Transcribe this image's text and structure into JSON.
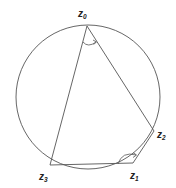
{
  "diagram": {
    "type": "inscribed-quadrilateral-in-circle",
    "circle": {
      "cx": 88,
      "cy": 97,
      "r": 72,
      "stroke": "#555555"
    },
    "points": [
      {
        "id": "z0",
        "base": "z",
        "sub": "0",
        "x": 87,
        "y": 26,
        "label_x": 78,
        "label_y": 17
      },
      {
        "id": "z1",
        "base": "z",
        "sub": "1",
        "x": 133,
        "y": 163,
        "label_x": 130,
        "label_y": 179
      },
      {
        "id": "z2",
        "base": "z",
        "sub": "2",
        "x": 154,
        "y": 131,
        "label_x": 157,
        "label_y": 138
      },
      {
        "id": "z3",
        "base": "z",
        "sub": "3",
        "x": 50,
        "y": 165,
        "label_x": 39,
        "label_y": 180
      }
    ],
    "edges": [
      [
        "z0",
        "z2"
      ],
      [
        "z2",
        "z1"
      ],
      [
        "z1",
        "z3"
      ],
      [
        "z3",
        "z0"
      ]
    ],
    "angle_marks": [
      {
        "at": "z0",
        "between": [
          "z3",
          "z2"
        ],
        "arrow": true
      },
      {
        "at": "z1",
        "between": [
          "z3",
          "z2"
        ],
        "arrow": true
      }
    ],
    "line_color": "#555555"
  }
}
